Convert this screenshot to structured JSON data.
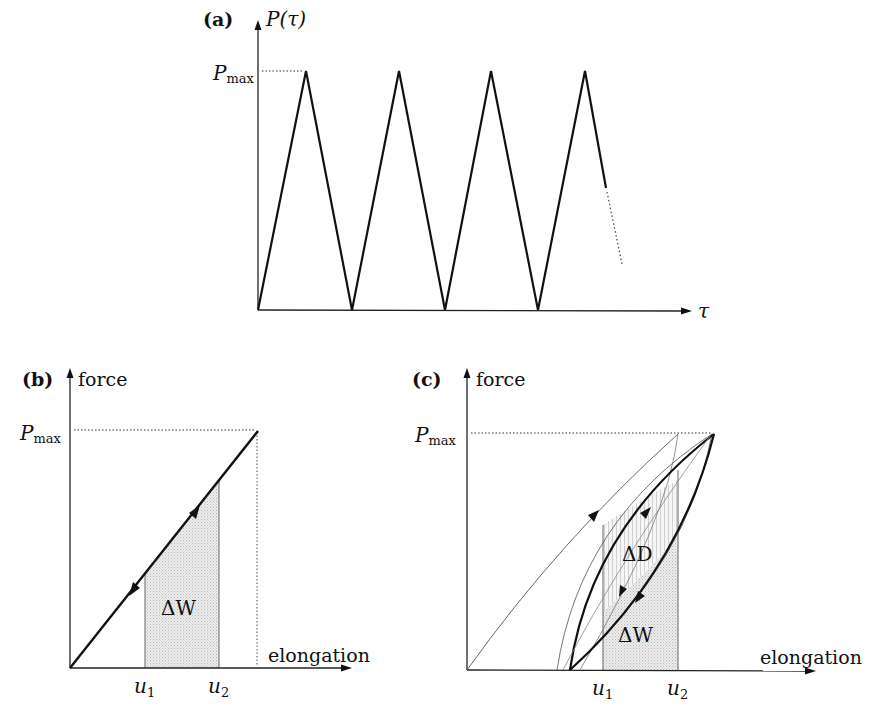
{
  "figure": {
    "panels": [
      {
        "id": "a",
        "tag": "(a)",
        "y_axis_label": "P(τ)",
        "x_axis_label": "τ",
        "ymax_label": "P",
        "ymax_sub": "max",
        "description": "Triangular cyclic loading P(τ) oscillating between 0 and Pmax; last descent continues as dotted line"
      },
      {
        "id": "b",
        "tag": "(b)",
        "y_axis_label": "force",
        "x_axis_label": "elongation",
        "ymax_label": "P",
        "ymax_sub": "max",
        "x_ticks": [
          {
            "label": "u",
            "sub": "1"
          },
          {
            "label": "u",
            "sub": "2"
          }
        ],
        "area_label": "ΔW",
        "description": "Elastic linear load/unload path; shaded area ΔW between u1 and u2"
      },
      {
        "id": "c",
        "tag": "(c)",
        "y_axis_label": "force",
        "x_axis_label": "elongation",
        "ymax_label": "P",
        "ymax_sub": "max",
        "x_ticks": [
          {
            "label": "u",
            "sub": "1"
          },
          {
            "label": "u",
            "sub": "2"
          }
        ],
        "area_labels": [
          "ΔD",
          "ΔW"
        ],
        "description": "Hysteresis loops with residual elongation; dissipated energy ΔD inside loop, ΔW below unloading curve between u1 and u2"
      }
    ]
  }
}
